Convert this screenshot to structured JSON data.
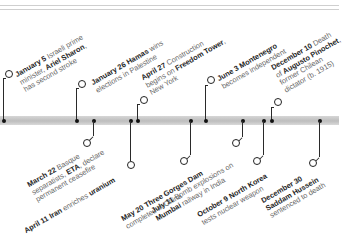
{
  "timeline": {
    "colors": {
      "bar": "#c8c8c8",
      "leader": "#2a2a2a",
      "text_bold": "#1e1e1e",
      "text_light": "#666666"
    },
    "top_events": [
      {
        "date": "January 5",
        "lines": [
          "Israeli prime",
          "minister, Ariel Sharon,",
          "has second stroke"
        ],
        "l1_rest": " Israeli prime",
        "l2_pre": "minister, ",
        "l2_bold": "Ariel Sharon",
        "l2_post": ",",
        "l3": "has second stroke"
      },
      {
        "date": "January 26",
        "l1_bold": "Hamas",
        "l1_rest": " wins",
        "l2": "elections in Palestine"
      },
      {
        "date": "April 27",
        "l1_rest": " Construction",
        "l2_pre": "begins on ",
        "l2_bold": "Freedom Tower",
        "l2_post": ",",
        "l3": "New York"
      },
      {
        "date": "June 3",
        "l1_bold": "Montenegro",
        "l2": "becomes independent"
      },
      {
        "date": "December 10",
        "l1_rest": " Death",
        "l2_pre": "of ",
        "l2_bold": "Augusto Pinochet",
        "l2_post": ",",
        "l3": "former Chilean",
        "l4": "dictator (b. 1915)"
      }
    ],
    "bottom_events": [
      {
        "date": "March 22",
        "l1_rest": " Basque",
        "l2_pre": "separatists, ",
        "l2_bold": "ETA",
        "l2_post": ", declare",
        "l3": "permanent ceasefire"
      },
      {
        "date": "April 11",
        "l1_bold": "Iran",
        "l1_rest": " enriches ",
        "l1_bold2": "uranium"
      },
      {
        "date": "May 20",
        "l1_bold": "Three Gorges Dam",
        "l2": "completed in China"
      },
      {
        "date": "July 11",
        "l1_rest": " Bomb explosions on",
        "l2_bold": "Mumbai",
        "l2_post": " railway in India"
      },
      {
        "date": "October 9",
        "l1_bold": "North Korea",
        "l2": "tests nuclear weapon"
      },
      {
        "date": "December 30",
        "l2_bold": "Saddam Hussein",
        "l3": "sentenced to death"
      }
    ]
  }
}
